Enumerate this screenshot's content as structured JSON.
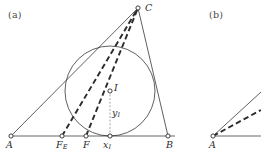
{
  "figure": {
    "caption_tags": {
      "panel_a": "(a)",
      "panel_b": "(b)"
    },
    "colors": {
      "stroke": "#2b2b2b",
      "baseline": "#555555",
      "label": "#2b2b2b",
      "tag": "#4a4a4a",
      "background": "#ffffff",
      "vertex_fill": "#ffffff"
    }
  },
  "panel_a": {
    "name": "triangle-with-incircle",
    "labels": {
      "vertex_A": "A",
      "vertex_B": "B",
      "vertex_C": "C",
      "incenter_I": "I",
      "foot_FE": "F",
      "foot_FE_sub": "E",
      "foot_F": "F",
      "abscissa_x": "x",
      "abscissa_x_sub": "I",
      "ordinate_y": "y",
      "ordinate_y_sub": "I"
    },
    "points": {
      "A": {
        "x": 11,
        "y": 136
      },
      "B": {
        "x": 168,
        "y": 136
      },
      "C": {
        "x": 138,
        "y": 8
      },
      "I": {
        "x": 110,
        "y": 91
      },
      "FE": {
        "x": 62,
        "y": 136
      },
      "F": {
        "x": 86,
        "y": 136
      },
      "xI": {
        "x": 110,
        "y": 136
      }
    },
    "incircle": {
      "cx": 110,
      "cy": 91,
      "r": 45
    },
    "segments": [
      {
        "name": "side-AB",
        "style": "solid",
        "from": "A",
        "to": "B"
      },
      {
        "name": "side-AC",
        "style": "solid",
        "from": "A",
        "to": "C"
      },
      {
        "name": "side-BC",
        "style": "solid",
        "from": "B",
        "to": "C"
      },
      {
        "name": "cevian-FE-to-C",
        "style": "dashed",
        "from": "FE",
        "to": "C"
      },
      {
        "name": "cevian-F-to-C",
        "style": "dashed",
        "from": "F",
        "to": "C"
      },
      {
        "name": "ordinate-drop-I",
        "style": "dotted",
        "from": "I",
        "to": "xI"
      }
    ]
  },
  "panel_b": {
    "name": "triangle-vertex-detail",
    "labels": {
      "vertex_A": "A"
    },
    "points": {
      "A": {
        "x": 213,
        "y": 136
      }
    },
    "segments": [
      {
        "name": "baseline-from-A",
        "style": "solid"
      },
      {
        "name": "side-from-A",
        "style": "solid"
      },
      {
        "name": "cevian-from-A",
        "style": "dashed"
      }
    ]
  }
}
